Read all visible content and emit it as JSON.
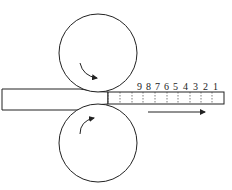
{
  "diagram": {
    "title": "",
    "stroke_color": "#222222",
    "rolls": [
      {
        "name": "upper-roll",
        "rotation": "clockwise"
      },
      {
        "name": "lower-roll",
        "rotation": "counterclockwise"
      }
    ],
    "segment_labels": [
      "9",
      "8",
      "7",
      "6",
      "5",
      "4",
      "3",
      "2",
      "1"
    ],
    "feed_direction": "right"
  }
}
